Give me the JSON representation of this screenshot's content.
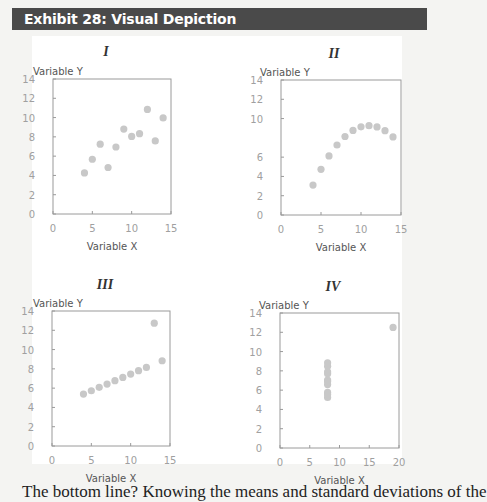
{
  "exhibit": {
    "title": "Exhibit 28: Visual Depiction"
  },
  "footer": {
    "text": "The bottom line? Knowing the means and standard deviations of the"
  },
  "colors": {
    "header_bg": "#4a4a4a",
    "header_text": "#ffffff",
    "point": "#c8c8c8",
    "axis": "#9a9a9a",
    "tick_label": "#a0a0a0",
    "axis_label": "#555555"
  },
  "chart_data": [
    {
      "type": "scatter",
      "title": "I",
      "xlabel": "Variable X",
      "ylabel": "Variable Y",
      "xlim": [
        0,
        15
      ],
      "ylim": [
        0,
        14
      ],
      "xticks": [
        "0",
        "5",
        "10",
        "15"
      ],
      "yticks": [
        "0",
        "2",
        "4",
        "6",
        "8",
        "10",
        "12",
        "14"
      ],
      "grid": false,
      "x": [
        10,
        8,
        13,
        9,
        11,
        14,
        6,
        4,
        12,
        7,
        5
      ],
      "y": [
        8.04,
        6.95,
        7.58,
        8.81,
        8.33,
        9.96,
        7.24,
        4.26,
        10.84,
        4.82,
        5.68
      ]
    },
    {
      "type": "scatter",
      "title": "II",
      "xlabel": "Variable X",
      "ylabel": "Variable Y",
      "xlim": [
        0,
        15
      ],
      "ylim": [
        0,
        14
      ],
      "xticks": [
        "0",
        "5",
        "10",
        "15"
      ],
      "yticks": [
        "0",
        "2",
        "4",
        "6",
        "10",
        "12",
        "14"
      ],
      "grid": false,
      "x": [
        10,
        8,
        13,
        9,
        11,
        14,
        6,
        4,
        12,
        7,
        5
      ],
      "y": [
        9.14,
        8.14,
        8.74,
        8.77,
        9.26,
        8.1,
        6.13,
        3.1,
        9.13,
        7.26,
        4.74
      ]
    },
    {
      "type": "scatter",
      "title": "III",
      "xlabel": "Variable X",
      "ylabel": "Variable Y",
      "xlim": [
        0,
        15
      ],
      "ylim": [
        0,
        14
      ],
      "xticks": [
        "0",
        "5",
        "10",
        "15"
      ],
      "yticks": [
        "0",
        "2",
        "4",
        "6",
        "8",
        "10",
        "12",
        "14"
      ],
      "grid": false,
      "x": [
        10,
        8,
        13,
        9,
        11,
        14,
        6,
        4,
        12,
        7,
        5
      ],
      "y": [
        7.46,
        6.77,
        12.74,
        7.11,
        7.81,
        8.84,
        6.08,
        5.39,
        8.15,
        6.42,
        5.73
      ]
    },
    {
      "type": "scatter",
      "title": "IV",
      "xlabel": "Variable X",
      "ylabel": "Variable Y",
      "xlim": [
        0,
        20
      ],
      "ylim": [
        0,
        14
      ],
      "xticks": [
        "0",
        "5",
        "10",
        "15",
        "20"
      ],
      "yticks": [
        "0",
        "2",
        "4",
        "6",
        "8",
        "10",
        "12",
        "14"
      ],
      "grid": false,
      "x": [
        8,
        8,
        8,
        8,
        8,
        8,
        8,
        19,
        8,
        8,
        8
      ],
      "y": [
        6.58,
        5.76,
        7.71,
        8.84,
        8.47,
        7.04,
        5.25,
        12.5,
        5.56,
        7.91,
        6.89
      ]
    }
  ]
}
